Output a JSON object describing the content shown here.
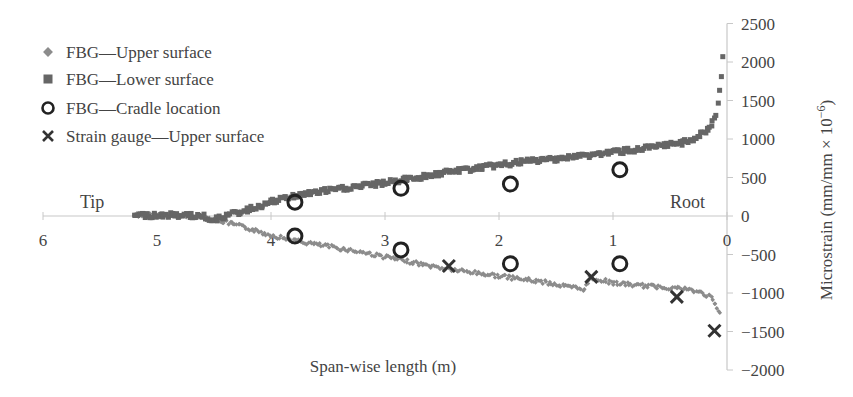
{
  "chart_data": {
    "type": "scatter",
    "title": "",
    "xlabel": "Span-wise length (m)",
    "ylabel": "Microstrain (mm/mm × 10⁻⁶)",
    "xlim": [
      6,
      0
    ],
    "ylim": [
      -2000,
      2500
    ],
    "x_reversed": true,
    "x_ticks": [
      "6",
      "5",
      "4",
      "3",
      "2",
      "1",
      "0"
    ],
    "y_ticks": [
      "2500",
      "2000",
      "1500",
      "1000",
      "500",
      "0",
      "-500",
      "-1000",
      "-1500",
      "-2000"
    ],
    "y_axis_position": "right",
    "grid": false,
    "legend_position": "upper left",
    "annotations": [
      {
        "text": "Tip",
        "x": 5.6,
        "y": 200
      },
      {
        "text": "Root",
        "x": 0.3,
        "y": 200
      }
    ],
    "series": [
      {
        "name": "FBG—Upper surface",
        "marker": "diamond",
        "color": "#8c8c8c",
        "x": [
          5.2,
          5.0,
          4.8,
          4.6,
          4.5,
          4.4,
          4.2,
          4.0,
          3.8,
          3.6,
          3.4,
          3.2,
          3.0,
          2.8,
          2.6,
          2.4,
          2.2,
          2.0,
          1.8,
          1.6,
          1.4,
          1.25,
          1.2,
          1.0,
          0.8,
          0.6,
          0.4,
          0.3,
          0.2,
          0.15,
          0.1,
          0.06
        ],
        "values": [
          10,
          10,
          5,
          -10,
          -40,
          -80,
          -160,
          -250,
          -320,
          -370,
          -420,
          -470,
          -530,
          -590,
          -650,
          -700,
          -740,
          -780,
          -820,
          -860,
          -920,
          -950,
          -800,
          -870,
          -900,
          -920,
          -940,
          -970,
          -1010,
          -1050,
          -1150,
          -1280
        ]
      },
      {
        "name": "FBG—Lower surface",
        "marker": "square",
        "color": "#666666",
        "x": [
          5.2,
          5.0,
          4.8,
          4.6,
          4.5,
          4.4,
          4.2,
          4.0,
          3.8,
          3.6,
          3.4,
          3.2,
          3.0,
          2.8,
          2.6,
          2.4,
          2.2,
          2.0,
          1.8,
          1.6,
          1.4,
          1.2,
          1.0,
          0.8,
          0.6,
          0.4,
          0.3,
          0.2,
          0.15,
          0.1,
          0.08,
          0.06,
          0.05,
          0.04
        ],
        "values": [
          10,
          10,
          10,
          0,
          -50,
          0,
          80,
          180,
          260,
          310,
          350,
          390,
          430,
          480,
          530,
          580,
          620,
          660,
          700,
          730,
          760,
          790,
          830,
          860,
          900,
          950,
          1000,
          1080,
          1150,
          1300,
          1450,
          1650,
          1800,
          2100
        ]
      },
      {
        "name": "FBG—Cradle location",
        "marker": "circle",
        "color": "#222222",
        "x": [
          3.79,
          2.86,
          1.9,
          0.94,
          3.79,
          2.86,
          1.9,
          0.94
        ],
        "values": [
          180,
          360,
          415,
          600,
          -260,
          -440,
          -620,
          -620
        ]
      },
      {
        "name": "Strain gauge—Upper surface",
        "marker": "x",
        "color": "#333333",
        "x": [
          2.44,
          1.19,
          0.44,
          0.11
        ],
        "values": [
          -650,
          -790,
          -1050,
          -1490
        ]
      }
    ]
  },
  "legend": [
    {
      "label": "FBG—Upper surface",
      "marker": "diamond-icon"
    },
    {
      "label": "FBG—Lower surface",
      "marker": "square-icon"
    },
    {
      "label": "FBG—Cradle location",
      "marker": "circle-icon"
    },
    {
      "label": "Strain gauge—Upper surface",
      "marker": "x-icon"
    }
  ],
  "labels": {
    "tip": "Tip",
    "root": "Root",
    "xlabel": "Span-wise length (m)",
    "ylabel": "Microstrain (mm/mm × 10⁻⁶)"
  }
}
